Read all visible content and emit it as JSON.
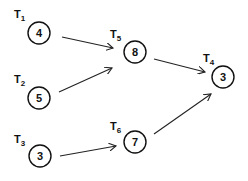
{
  "diagram": {
    "type": "task-graph",
    "nodes": [
      {
        "id": "T1",
        "label_main": "T",
        "label_sub": "1",
        "value": "4",
        "cx": 39,
        "cy": 33,
        "lx": 14,
        "ly": 18
      },
      {
        "id": "T2",
        "label_main": "T",
        "label_sub": "2",
        "value": "5",
        "cx": 39,
        "cy": 98,
        "lx": 14,
        "ly": 83
      },
      {
        "id": "T3",
        "label_main": "T",
        "label_sub": "3",
        "value": "3",
        "cx": 40,
        "cy": 156,
        "lx": 14,
        "ly": 143
      },
      {
        "id": "T4",
        "label_main": "T",
        "label_sub": "4",
        "value": "3",
        "cx": 223,
        "cy": 77,
        "lx": 203,
        "ly": 62
      },
      {
        "id": "T5",
        "label_main": "T",
        "label_sub": "5",
        "value": "8",
        "cx": 135,
        "cy": 52,
        "lx": 110,
        "ly": 38
      },
      {
        "id": "T6",
        "label_main": "T",
        "label_sub": "6",
        "value": "7",
        "cx": 135,
        "cy": 142,
        "lx": 110,
        "ly": 130
      }
    ],
    "edges": [
      {
        "from": "T1",
        "to": "T5",
        "x1": 62,
        "y1": 37,
        "x2": 113,
        "y2": 48
      },
      {
        "from": "T2",
        "to": "T5",
        "x1": 59,
        "y1": 92,
        "x2": 112,
        "y2": 68
      },
      {
        "from": "T3",
        "to": "T6",
        "x1": 60,
        "y1": 156,
        "x2": 116,
        "y2": 146
      },
      {
        "from": "T5",
        "to": "T4",
        "x1": 154,
        "y1": 59,
        "x2": 205,
        "y2": 72
      },
      {
        "from": "T6",
        "to": "T4",
        "x1": 154,
        "y1": 134,
        "x2": 211,
        "y2": 94
      }
    ],
    "node_radius": 11,
    "colors": {
      "stroke": "#111111",
      "background": "#ffffff"
    }
  }
}
